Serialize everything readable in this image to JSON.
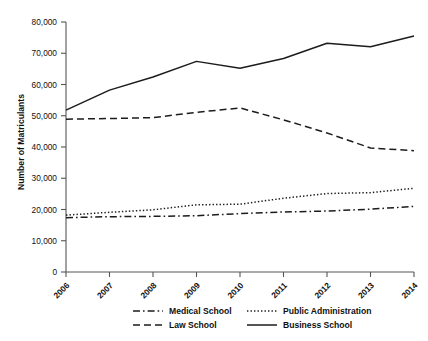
{
  "chart_data": {
    "type": "line",
    "title": "",
    "xlabel": "",
    "ylabel": "Number of Matriculants",
    "categories": [
      "2006",
      "2007",
      "2008",
      "2009",
      "2010",
      "2011",
      "2012",
      "2013",
      "2014"
    ],
    "x": [
      2006,
      2007,
      2008,
      2009,
      2010,
      2011,
      2012,
      2013,
      2014
    ],
    "ylim": [
      0,
      80000
    ],
    "yticks": [
      0,
      10000,
      20000,
      30000,
      40000,
      50000,
      60000,
      70000,
      80000
    ],
    "ytick_labels": [
      "0",
      "10,000",
      "20,000",
      "30,000",
      "40,000",
      "50,000",
      "60,000",
      "70,000",
      "80,000"
    ],
    "grid": false,
    "legend_position": "bottom",
    "series": [
      {
        "name": "Medical School",
        "style": "dash-dot",
        "values": [
          17400,
          17700,
          17800,
          18000,
          18700,
          19200,
          19500,
          20100,
          21000
        ]
      },
      {
        "name": "Public Administration",
        "style": "dotted",
        "values": [
          18200,
          19100,
          19900,
          21500,
          21700,
          23600,
          25100,
          25400,
          26800
        ]
      },
      {
        "name": "Law School",
        "style": "dashed",
        "values": [
          48900,
          49100,
          49400,
          51100,
          52500,
          48700,
          44500,
          39700,
          38800
        ]
      },
      {
        "name": "Business School",
        "style": "solid",
        "values": [
          51800,
          58200,
          62400,
          67400,
          65200,
          68300,
          73200,
          72100,
          75500
        ]
      }
    ]
  },
  "legend": {
    "entries": [
      {
        "label": "Medical School",
        "style": "dash-dot"
      },
      {
        "label": "Public Administration",
        "style": "dotted"
      },
      {
        "label": "Law School",
        "style": "dashed"
      },
      {
        "label": "Business School",
        "style": "solid"
      }
    ]
  },
  "axis": {
    "y_title": "Number of Matriculants"
  }
}
